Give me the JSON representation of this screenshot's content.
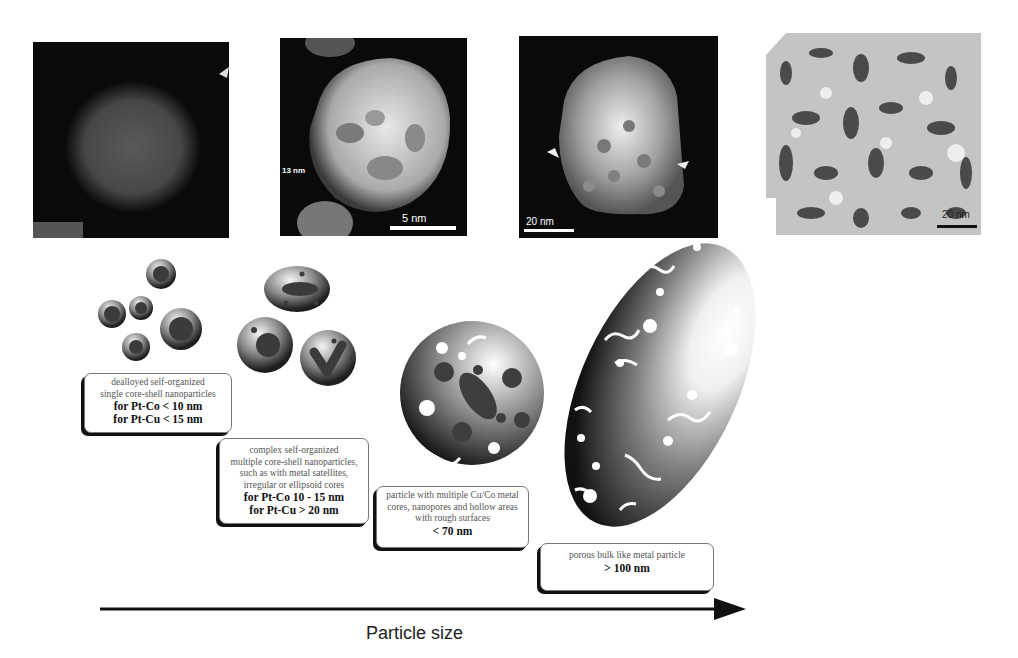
{
  "figure": {
    "type": "diagram"
  },
  "micrographs": [
    {
      "id": "stem-single-core-shell",
      "scale_label": ""
    },
    {
      "id": "stem-multiple-core-shell",
      "size_label": "13 nm",
      "scale_label": "5 nm"
    },
    {
      "id": "stem-multiple-cores-nanopores",
      "scale_label": "20 nm"
    },
    {
      "id": "sem-porous-bulk",
      "scale_label": "20 nm"
    }
  ],
  "stages": [
    {
      "description_lines": [
        "dealloyed self-organized",
        "single core-shell nanoparticles"
      ],
      "size_lines": [
        "for Pt-Co < 10 nm",
        "for Pt-Cu < 15 nm"
      ]
    },
    {
      "description_lines": [
        "complex self-organized",
        "multiple core-shell nanoparticles,",
        "such as with metal satellites,",
        "irregular or ellipsoid cores"
      ],
      "size_lines": [
        "for Pt-Co  10 - 15 nm",
        "for Pt-Cu > 20 nm"
      ]
    },
    {
      "description_lines": [
        "particle with multiple Cu/Co metal",
        "cores, nanopores and hollow areas",
        "with rough surfaces"
      ],
      "size_lines": [
        "< 70 nm"
      ]
    },
    {
      "description_lines": [
        "porous bulk like metal particle"
      ],
      "size_lines": [
        "> 100 nm"
      ]
    }
  ],
  "axis": {
    "label": "Particle size",
    "direction": "increasing left to right"
  },
  "colors": {
    "background": "#ffffff",
    "micrograph_bg": "#0a0a0a",
    "particle_dark": "#2a2a2a",
    "particle_light": "#f4f4f4",
    "arrow": "#111111"
  }
}
